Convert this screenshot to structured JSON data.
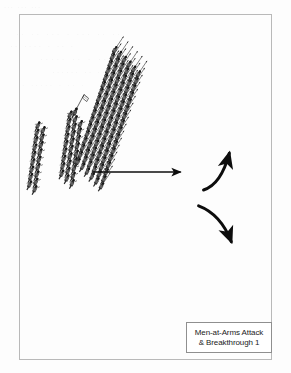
{
  "page": {
    "background_color": "#fdfdfd",
    "scan_artifact_note": "faint bleed-through text from reverse of page, illegible",
    "ghost_text": [
      "... ... ...",
      "·· ·· ··· · ··· ·· ··",
      "·· ···· · ·· ·",
      "····· ·· · ··",
      "······ ·· ··",
      "· ····· · ·· ·"
    ]
  },
  "frame": {
    "border_color": "#b9b9b9",
    "x": 19,
    "y": 14,
    "width": 253,
    "height": 346
  },
  "caption": {
    "line1": "Men-at-Arms Attack",
    "line2": "& Breakthrough 1",
    "border_color": "#8f8f8f",
    "background_color": "#ffffff",
    "text_color": "#1b1b1b"
  },
  "diagram": {
    "type": "military-tactical-diagram",
    "ink_color": "#1a1a1a",
    "units": [
      {
        "id": "men-at-arms-block-left",
        "label": "Men-at-Arms formation (left)",
        "role": "attacker",
        "troop_type": "men-at-arms",
        "columns": 2,
        "rows": 8,
        "angle_deg": -62,
        "has_standard": false,
        "x": 34,
        "y": 120,
        "width": 30,
        "height": 82
      },
      {
        "id": "men-at-arms-block-right",
        "label": "Men-at-Arms formation (centre) with standard bearer",
        "role": "attacker",
        "troop_type": "men-at-arms",
        "columns": 3,
        "rows": 9,
        "angle_deg": -62,
        "has_standard": true,
        "x": 68,
        "y": 104,
        "width": 34,
        "height": 98
      },
      {
        "id": "pike-block-main",
        "label": "Pike / spear formation (defender)",
        "role": "defender",
        "troop_type": "spearmen-pikemen",
        "columns": 6,
        "rows": 17,
        "angle_deg": -56,
        "has_standard": false,
        "x": 130,
        "y": 48,
        "width": 112,
        "height": 272
      }
    ],
    "arrows": [
      {
        "id": "attack-arrow",
        "kind": "straight",
        "label": "men-at-arms attack vector",
        "from_x": 93,
        "from_y": 172,
        "to_x": 184,
        "to_y": 172
      },
      {
        "id": "breakthrough-arrow-upper",
        "kind": "curved",
        "label": "breakthrough, upper wing",
        "from_x": 210,
        "from_y": 185,
        "to_x": 253,
        "to_y": 146
      },
      {
        "id": "breakthrough-arrow-lower",
        "kind": "curved",
        "label": "breakthrough, lower wing",
        "from_x": 206,
        "from_y": 203,
        "to_x": 250,
        "to_y": 238
      }
    ]
  }
}
